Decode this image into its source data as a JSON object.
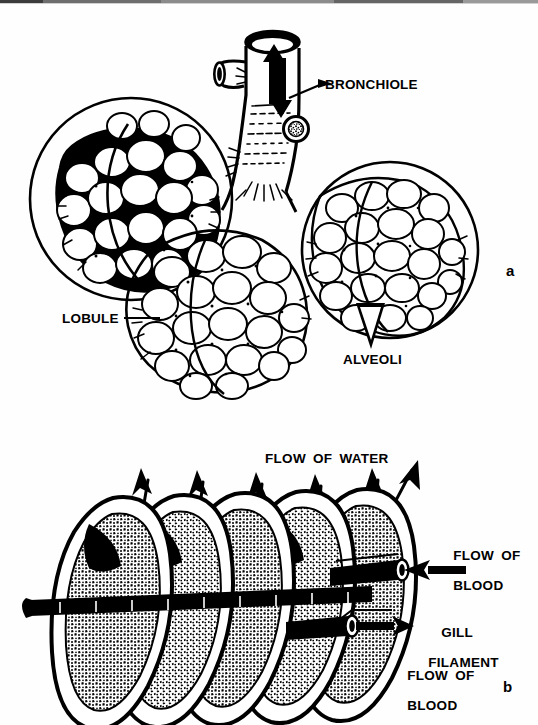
{
  "figure": {
    "background_color": "#ffffff",
    "ink_color": "#000000",
    "width": 538,
    "height": 725
  },
  "panel_a": {
    "marker": "a",
    "subject": "mammalian-lung-alveoli",
    "labels": {
      "bronchiole": "BRONCHIOLE",
      "lobule": "LOBULE",
      "alveoli": "ALVEOLI"
    },
    "airflow": {
      "inhale_arrow": "arrow-up",
      "exhale_arrow": "arrow-down",
      "description": "tidal bidirectional air flow"
    },
    "lobule_count": 3
  },
  "panel_b": {
    "marker": "b",
    "subject": "fish-gill-filament-lamellae",
    "labels": {
      "flow_of_water": "FLOW OF WATER",
      "flow_of_blood_upper_line1": "FLOW OF",
      "flow_of_blood_upper_line2": "BLOOD",
      "gill_filament_line1": "GILL",
      "gill_filament_line2": "FILAMENT",
      "flow_of_blood_lower_line1": "FLOW OF",
      "flow_of_blood_lower_line2": "BLOOD"
    },
    "lamella_count": 5,
    "water_arrow_count": 6,
    "blood_vessels": [
      {
        "name": "afferent-vessel",
        "arrow_direction": "left"
      },
      {
        "name": "efferent-vessel",
        "arrow_direction": "right"
      }
    ],
    "flow_type": "countercurrent"
  }
}
